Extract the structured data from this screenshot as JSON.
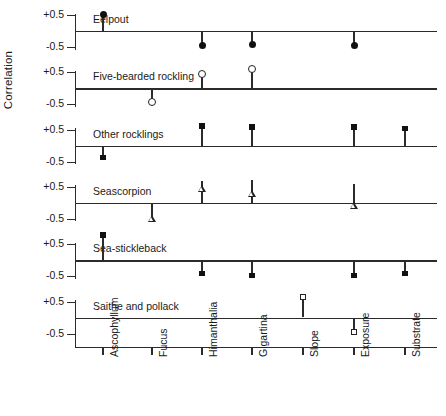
{
  "chart_data": {
    "type": "scatter",
    "title": "",
    "xlabel": "",
    "ylabel": "Correlation",
    "ylim": [
      -1.0,
      1.0
    ],
    "ytick_values": [
      0.5,
      -0.5
    ],
    "ytick_labels": [
      "+0.5",
      "-0.5"
    ],
    "grid": false,
    "legend": "none",
    "categories": [
      "Ascophyllum",
      "Fucus",
      "Himanthalia",
      "Gigartina",
      "Slope",
      "Exposure",
      "Substrate"
    ],
    "panels": [
      {
        "name": "Eelpout",
        "marker": "circle-filled",
        "points": [
          {
            "category": "Ascophyllum",
            "value": 0.52
          },
          {
            "category": "Fucus",
            "value": null
          },
          {
            "category": "Himanthalia",
            "value": -0.45
          },
          {
            "category": "Gigartina",
            "value": -0.42
          },
          {
            "category": "Slope",
            "value": null
          },
          {
            "category": "Exposure",
            "value": -0.46
          },
          {
            "category": "Substrate",
            "value": null
          }
        ]
      },
      {
        "name": "Five-bearded rockling",
        "marker": "circle-open",
        "points": [
          {
            "category": "Ascophyllum",
            "value": null
          },
          {
            "category": "Fucus",
            "value": -0.45
          },
          {
            "category": "Himanthalia",
            "value": 0.44
          },
          {
            "category": "Gigartina",
            "value": 0.6
          },
          {
            "category": "Slope",
            "value": null
          },
          {
            "category": "Exposure",
            "value": null
          },
          {
            "category": "Substrate",
            "value": null
          }
        ]
      },
      {
        "name": "Other rocklings",
        "marker": "square-filled",
        "points": [
          {
            "category": "Ascophyllum",
            "value": -0.37
          },
          {
            "category": "Fucus",
            "value": null
          },
          {
            "category": "Himanthalia",
            "value": 0.62
          },
          {
            "category": "Gigartina",
            "value": 0.58
          },
          {
            "category": "Slope",
            "value": null
          },
          {
            "category": "Exposure",
            "value": 0.58
          },
          {
            "category": "Substrate",
            "value": 0.53
          }
        ]
      },
      {
        "name": "Seascorpion",
        "marker": "triangle-open",
        "points": [
          {
            "category": "Ascophyllum",
            "value": null
          },
          {
            "category": "Fucus",
            "value": -0.5
          },
          {
            "category": "Himanthalia",
            "value": 0.68
          },
          {
            "category": "Gigartina",
            "value": 0.72
          },
          {
            "category": "Slope",
            "value": null
          },
          {
            "category": "Exposure",
            "value": 0.58
          },
          {
            "category": "Substrate",
            "value": null
          }
        ]
      },
      {
        "name": "Sea-stickleback",
        "marker": "square-filled",
        "points": [
          {
            "category": "Ascophyllum",
            "value": 0.78
          },
          {
            "category": "Fucus",
            "value": null
          },
          {
            "category": "Himanthalia",
            "value": -0.42
          },
          {
            "category": "Gigartina",
            "value": -0.48
          },
          {
            "category": "Slope",
            "value": null
          },
          {
            "category": "Exposure",
            "value": -0.48
          },
          {
            "category": "Substrate",
            "value": -0.42
          }
        ]
      },
      {
        "name": "Saithe and pollack",
        "marker": "square-open",
        "points": [
          {
            "category": "Ascophyllum",
            "value": null
          },
          {
            "category": "Fucus",
            "value": null
          },
          {
            "category": "Himanthalia",
            "value": null
          },
          {
            "category": "Gigartina",
            "value": null
          },
          {
            "category": "Slope",
            "value": 0.62
          },
          {
            "category": "Exposure",
            "value": -0.45
          },
          {
            "category": "Substrate",
            "value": null
          }
        ]
      }
    ]
  },
  "colors": {
    "ink": "#2b2b2b",
    "marker": "#111111",
    "background": "#ffffff"
  }
}
